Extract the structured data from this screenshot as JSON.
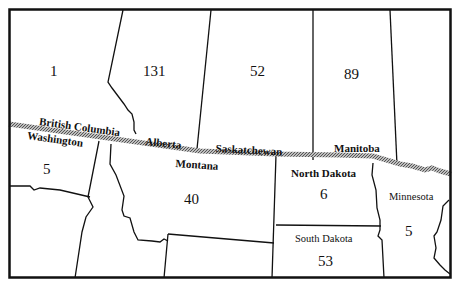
{
  "map": {
    "type": "choropleth-count-map",
    "border_label": "US-Canada border",
    "regions": [
      {
        "id": "british-columbia",
        "name": "British Columbia",
        "value": "1",
        "country": "Canada"
      },
      {
        "id": "alberta",
        "name": "Alberta",
        "value": "131",
        "country": "Canada"
      },
      {
        "id": "saskatchewan",
        "name": "Saskatchewan",
        "value": "52",
        "country": "Canada"
      },
      {
        "id": "manitoba",
        "name": "Manitoba",
        "value": "89",
        "country": "Canada"
      },
      {
        "id": "washington",
        "name": "Washington",
        "value": "5",
        "country": "USA"
      },
      {
        "id": "montana",
        "name": "Montana",
        "value": "40",
        "country": "USA"
      },
      {
        "id": "north-dakota",
        "name": "North Dakota",
        "value": "6",
        "country": "USA"
      },
      {
        "id": "south-dakota",
        "name": "South Dakota",
        "value": "53",
        "country": "USA"
      },
      {
        "id": "minnesota",
        "name": "Minnesota",
        "value": "5",
        "country": "USA"
      }
    ]
  },
  "colors": {
    "ink": "#111111",
    "border_band": "#8a8a8a",
    "background": "#ffffff"
  }
}
